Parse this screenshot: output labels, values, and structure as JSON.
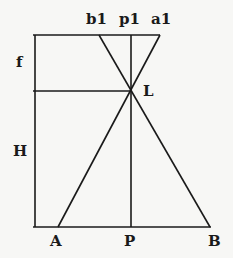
{
  "diagram": {
    "type": "geometric-construction",
    "line_color": "#1a1a1a",
    "background_color": "#f7f7f5",
    "labels": {
      "b1": "b1",
      "p1": "p1",
      "a1": "a1",
      "f": "f",
      "L": "L",
      "H": "H",
      "A": "A",
      "P": "P",
      "B": "B"
    },
    "points": {
      "b1": [
        99,
        35
      ],
      "p1": [
        131,
        35
      ],
      "a1": [
        160,
        35
      ],
      "L": [
        131,
        91
      ],
      "A": [
        58,
        227
      ],
      "P": [
        131,
        227
      ],
      "B": [
        210,
        227
      ]
    },
    "segments": [
      {
        "name": "top-line",
        "from": [
          33,
          35
        ],
        "to": [
          160,
          35
        ]
      },
      {
        "name": "focal-line",
        "from": [
          33,
          91
        ],
        "to": [
          131,
          91
        ]
      },
      {
        "name": "ground-line",
        "from": [
          33,
          227
        ],
        "to": [
          211,
          227
        ]
      },
      {
        "name": "left-vertical",
        "from": [
          35,
          35
        ],
        "to": [
          35,
          227
        ]
      },
      {
        "name": "center-vertical",
        "from": [
          131,
          35
        ],
        "to": [
          131,
          227
        ]
      },
      {
        "name": "ray-b1-B",
        "from": [
          99,
          35
        ],
        "to": [
          210,
          227
        ]
      },
      {
        "name": "ray-a1-A",
        "from": [
          160,
          35
        ],
        "to": [
          58,
          227
        ]
      }
    ]
  }
}
